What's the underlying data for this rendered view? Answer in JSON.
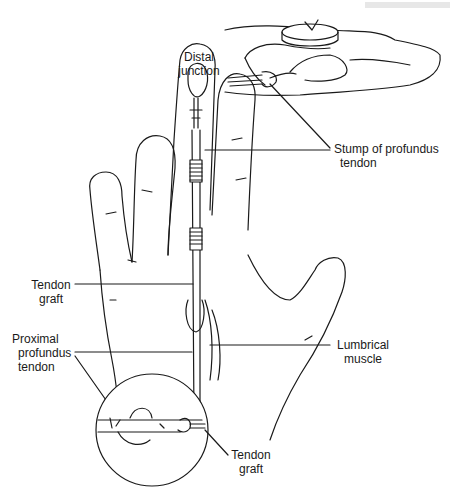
{
  "figure": {
    "header_fragment": "",
    "labels": {
      "distal_junction": [
        "Distal",
        "junction"
      ],
      "stump_of_profundus_tendon": [
        "Stump of profundus",
        "tendon"
      ],
      "tendon_graft_upper": [
        "Tendon",
        "graft"
      ],
      "proximal_profundus_tendon": [
        "Proximal",
        "profundus",
        "tendon"
      ],
      "lumbrical_muscle": [
        "Lumbrical",
        "muscle"
      ],
      "tendon_graft_lower": [
        "Tendon",
        "graft"
      ]
    },
    "colors": {
      "line": "#1a1a1a",
      "background": "#ffffff"
    }
  }
}
